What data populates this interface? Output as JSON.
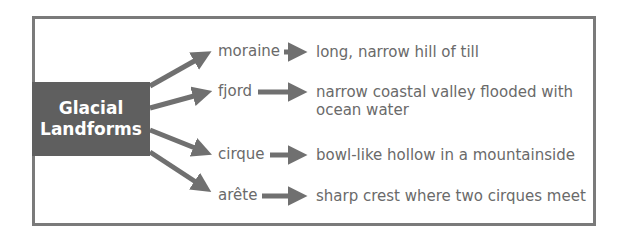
{
  "hub": {
    "line1": "Glacial",
    "line2": "Landforms"
  },
  "items": [
    {
      "term": "moraine",
      "definition": "long, narrow hill of till"
    },
    {
      "term": "fjord",
      "definition_line1": "narrow coastal valley flooded with",
      "definition_line2": "ocean water"
    },
    {
      "term": "cirque",
      "definition": "bowl-like hollow in a mountainside"
    },
    {
      "term": "arête",
      "definition": "sharp crest where two cirques meet"
    }
  ],
  "colors": {
    "hub_fill": "#5f5f5f",
    "arrow": "#707070",
    "text": "#6a6a6a",
    "border": "#7a7a7a"
  }
}
